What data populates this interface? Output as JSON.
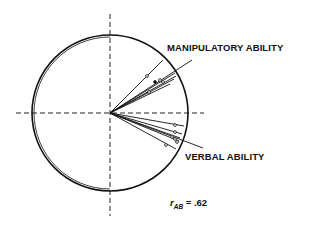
{
  "diagram": {
    "type": "vector-correlation-circle",
    "labels": {
      "vector_a": "MANIPULATORY ABILITY",
      "vector_b": "VERBAL ABILITY"
    },
    "correlation": {
      "symbol": "r",
      "subscript": "AB",
      "equals": "= .62"
    },
    "colors": {
      "ink": "#111111",
      "background": "#ffffff"
    }
  }
}
